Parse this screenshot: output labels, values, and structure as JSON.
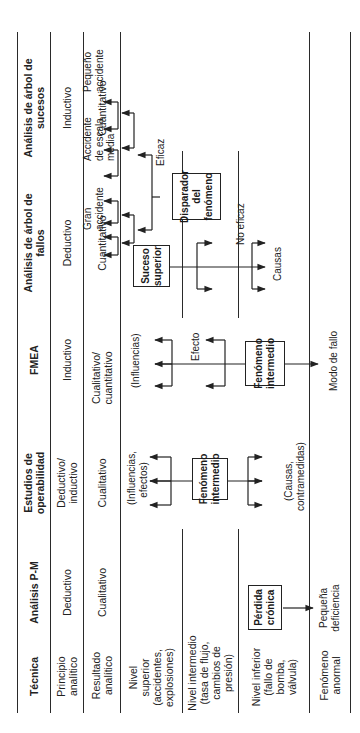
{
  "table": {
    "headers": [
      "Técnica",
      "Análisis P-M",
      "Estudios de operabilidad",
      "FMEA",
      "Análisis de árbol de fallos",
      "Análisis de árbol de sucesos"
    ],
    "rows": [
      {
        "label": "Principio analítico",
        "values": [
          "Deductivo",
          "Deductivo/ inductivo",
          "Inductivo",
          "Deductivo",
          "Inductivo"
        ]
      },
      {
        "label": "Resultado analítico",
        "values": [
          "Cualitativo",
          "Cualitativo",
          "Cualitativo/ cuantitativo",
          "Cuantitativo",
          "Cuantitativo"
        ]
      },
      {
        "label": "Nivel superior (accidentes, explosiones)"
      },
      {
        "label": "Nivel intermedio (tasa de flujo, cambios de presión)"
      },
      {
        "label": "Nivel inferior (fallo de bomba, válvula)"
      },
      {
        "label": "Fenómeno anormal"
      }
    ]
  },
  "diagram": {
    "pm": {
      "box": "Pérdida crónica",
      "output": "Pequeña deficiencia"
    },
    "hazop": {
      "box": "Fenómeno intermedio",
      "up": "(Influencias, efectos)",
      "down": "(Causas, contramedidas)"
    },
    "fmea": {
      "box": "Fenómeno intermedio",
      "up": "(Influencias)",
      "mid": "Efecto",
      "down": "Modo de fallo"
    },
    "fta": {
      "box": "Suceso superior",
      "down": "Causas"
    },
    "eta": {
      "box": "Disparador del fenómeno",
      "branch_yes": "Eficaz",
      "branch_no": "No eficaz",
      "outcomes": [
        "Pequeño accidente",
        "Accidente de escala media",
        "Gran accidente"
      ]
    }
  }
}
